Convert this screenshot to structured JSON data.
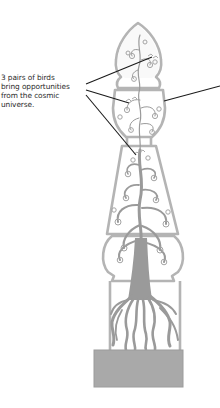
{
  "figure": {
    "annotation": {
      "lines": [
        "3 pairs of birds",
        "bring opportunities",
        "from the cosmic",
        "universe."
      ],
      "text": "3 pairs of birds bring opportunities from the cosmic universe."
    },
    "colors": {
      "outline": "#b4b4b4",
      "tree": "#9a9a9a",
      "base": "#a9a9a9",
      "leader_line": "#1a1a1a",
      "text": "#2a2a2a",
      "background": "#ffffff"
    },
    "leader_lines": [
      {
        "target": "birds-top-arch",
        "from": [
          86,
          84
        ],
        "to": [
          152,
          57
        ]
      },
      {
        "target": "birds-cup",
        "from": [
          86,
          90
        ],
        "to": [
          129,
          103
        ]
      },
      {
        "target": "birds-trapezoid",
        "from": [
          86,
          95
        ],
        "to": [
          136,
          155
        ]
      },
      {
        "target": "cup-right-detail",
        "from": [
          220,
          86
        ],
        "to": [
          164,
          101
        ]
      }
    ],
    "sections": [
      "top-arch",
      "cup",
      "trapezoid",
      "bulb",
      "root-panel",
      "base-slab"
    ]
  }
}
